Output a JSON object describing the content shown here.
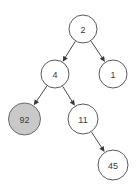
{
  "diagram": {
    "type": "tree",
    "width": 138,
    "height": 190,
    "background_color": "#ffffff",
    "node_stroke_color": "#5a5a5a",
    "node_fill_default": "#ffffff",
    "node_fill_highlight": "#c9c9c9",
    "edge_color": "#4a4a4a",
    "label_color": "#3a3a3a",
    "nodes": [
      {
        "id": "n2",
        "label": "2",
        "cx": 83,
        "cy": 29,
        "r": 14,
        "highlighted": false
      },
      {
        "id": "n4",
        "label": "4",
        "cx": 55,
        "cy": 74,
        "r": 14,
        "highlighted": false
      },
      {
        "id": "n1",
        "label": "1",
        "cx": 113,
        "cy": 74,
        "r": 14,
        "highlighted": false
      },
      {
        "id": "n92",
        "label": "92",
        "cx": 24.5,
        "cy": 119,
        "r": 16,
        "highlighted": true
      },
      {
        "id": "n11",
        "label": "11",
        "cx": 83,
        "cy": 119,
        "r": 15,
        "highlighted": false
      },
      {
        "id": "n45",
        "label": "45",
        "cx": 113,
        "cy": 165,
        "r": 15,
        "highlighted": false
      }
    ],
    "edges": [
      {
        "id": "e-2-4",
        "from": "n2",
        "to": "n4",
        "directed": true
      },
      {
        "id": "e-2-1",
        "from": "n2",
        "to": "n1",
        "directed": true
      },
      {
        "id": "e-4-92",
        "from": "n4",
        "to": "n92",
        "directed": true
      },
      {
        "id": "e-4-11",
        "from": "n4",
        "to": "n11",
        "directed": true
      },
      {
        "id": "e-11-45",
        "from": "n11",
        "to": "n45",
        "directed": true
      }
    ]
  }
}
